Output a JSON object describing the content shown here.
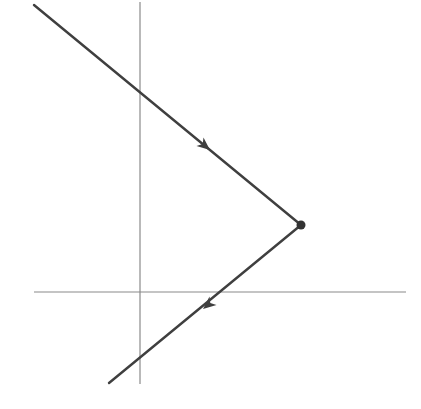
{
  "diagram": {
    "canvas": {
      "width": 421,
      "height": 409,
      "background": "#ffffff"
    },
    "colors": {
      "axis": "#8a8a8a",
      "ray": "#3f3f3f",
      "point": "#333333"
    },
    "axes": {
      "horizontal": {
        "x1": 34,
        "y1": 292,
        "x2": 406,
        "y2": 292
      },
      "vertical": {
        "x1": 140,
        "y1": 2,
        "x2": 140,
        "y2": 384
      }
    },
    "rays": [
      {
        "name": "incoming-ray",
        "x1": 34,
        "y1": 5,
        "x2": 301,
        "y2": 225,
        "arrow": {
          "tip_x": 210,
          "tip_y": 150,
          "direction": "down-right"
        }
      },
      {
        "name": "outgoing-ray",
        "x1": 301,
        "y1": 225,
        "x2": 109,
        "y2": 383,
        "arrow": {
          "tip_x": 203,
          "tip_y": 309,
          "direction": "down-left"
        }
      }
    ],
    "vertex": {
      "cx": 301,
      "cy": 225,
      "r": 4.5
    }
  }
}
